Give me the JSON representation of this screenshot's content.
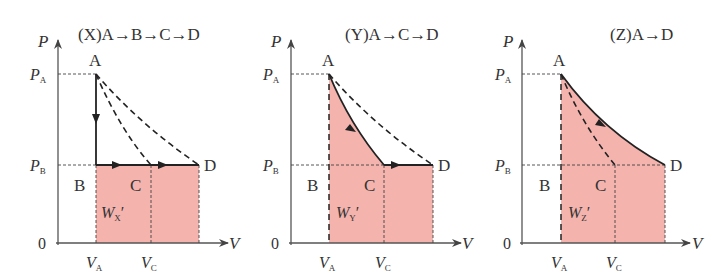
{
  "figure": {
    "fill_color": "#f4b3ad",
    "line_color": "#222222",
    "axis_color": "#555555",
    "panels": [
      {
        "id": "X",
        "title": "(X)A→B→C→D",
        "path_description": "isochoric A→B, then isobaric B→C→D",
        "axis_p_label": "P",
        "axis_v_label": "V",
        "origin_label": "0",
        "pa_label": "P",
        "pa_sub": "A",
        "pb_label": "P",
        "pb_sub": "B",
        "va_label": "V",
        "va_sub": "A",
        "vc_label": "V",
        "vc_sub": "C",
        "point_a": "A",
        "point_b": "B",
        "point_c": "C",
        "point_d": "D",
        "work_label": "W",
        "work_sub": "X",
        "work_prime": "′"
      },
      {
        "id": "Y",
        "title": "(Y)A→C→D",
        "path_description": "adiabatic A→C, then isobaric C→D",
        "axis_p_label": "P",
        "axis_v_label": "V",
        "origin_label": "0",
        "pa_label": "P",
        "pa_sub": "A",
        "pb_label": "P",
        "pb_sub": "B",
        "va_label": "V",
        "va_sub": "A",
        "vc_label": "V",
        "vc_sub": "C",
        "point_a": "A",
        "point_b": "B",
        "point_c": "C",
        "point_d": "D",
        "work_label": "W",
        "work_sub": "Y",
        "work_prime": "′"
      },
      {
        "id": "Z",
        "title": "(Z)A→D",
        "path_description": "isothermal A→D",
        "axis_p_label": "P",
        "axis_v_label": "V",
        "origin_label": "0",
        "pa_label": "P",
        "pa_sub": "A",
        "pb_label": "P",
        "pb_sub": "B",
        "va_label": "V",
        "va_sub": "A",
        "vc_label": "V",
        "vc_sub": "C",
        "point_a": "A",
        "point_b": "B",
        "point_c": "C",
        "point_d": "D",
        "work_label": "W",
        "work_sub": "Z",
        "work_prime": "′"
      }
    ]
  }
}
